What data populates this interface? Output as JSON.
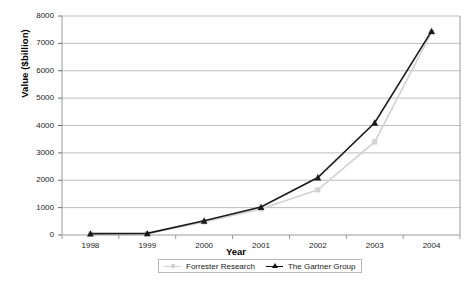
{
  "chart_data": {
    "type": "line",
    "title": "",
    "xlabel": "Year",
    "ylabel": "Value ($billion)",
    "categories": [
      "1998",
      "1999",
      "2000",
      "2001",
      "2002",
      "2003",
      "2004"
    ],
    "x": [
      1998,
      1999,
      2000,
      2001,
      2002,
      2003,
      2004
    ],
    "ylim": [
      0,
      8000
    ],
    "yticks": [
      0,
      1000,
      2000,
      3000,
      4000,
      5000,
      6000,
      7000,
      8000
    ],
    "ytick_labels": [
      "0",
      "1000",
      "2000",
      "3000",
      "4000",
      "5000",
      "6000",
      "7000",
      "8000"
    ],
    "grid": "horizontal",
    "legend_position": "bottom-center",
    "series": [
      {
        "name": "Forrester Research",
        "color": "#d2d2d2",
        "marker": "square",
        "values": [
          40,
          45,
          480,
          950,
          1650,
          3400,
          7400
        ]
      },
      {
        "name": "The Gartner Group",
        "color": "#1a1a1a",
        "marker": "triangle",
        "values": [
          50,
          60,
          520,
          1020,
          2100,
          4100,
          7450
        ]
      }
    ]
  },
  "legend": {
    "items": [
      {
        "label": "Forrester Research"
      },
      {
        "label": "The Gartner Group"
      }
    ]
  }
}
